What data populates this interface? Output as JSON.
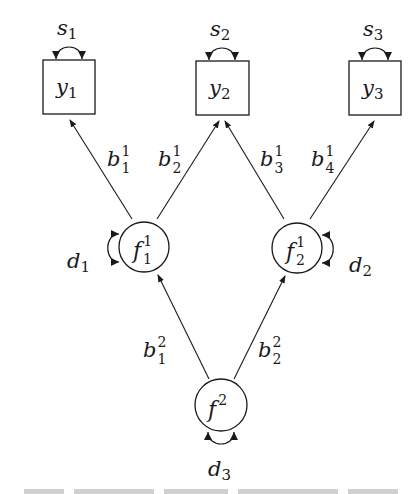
{
  "diagram": {
    "type": "path-diagram",
    "observed": [
      {
        "id": "y1",
        "name": "y",
        "sub": "1",
        "error": {
          "name": "s",
          "sub": "1"
        }
      },
      {
        "id": "y2",
        "name": "y",
        "sub": "2",
        "error": {
          "name": "s",
          "sub": "2"
        }
      },
      {
        "id": "y3",
        "name": "y",
        "sub": "3",
        "error": {
          "name": "s",
          "sub": "3"
        }
      }
    ],
    "first_order_factors": [
      {
        "id": "f1_1",
        "name": "f",
        "sup": "1",
        "sub": "1",
        "disturbance": {
          "name": "d",
          "sub": "1"
        }
      },
      {
        "id": "f2_1",
        "name": "f",
        "sup": "1",
        "sub": "2",
        "disturbance": {
          "name": "d",
          "sub": "2"
        }
      }
    ],
    "second_order_factor": {
      "id": "f2",
      "name": "f",
      "sup": "2",
      "disturbance": {
        "name": "d",
        "sub": "3"
      }
    },
    "loadings_level1": [
      {
        "name": "b",
        "sup": "1",
        "sub": "1",
        "from": "f1_1",
        "to": "y1"
      },
      {
        "name": "b",
        "sup": "1",
        "sub": "2",
        "from": "f1_1",
        "to": "y2"
      },
      {
        "name": "b",
        "sup": "1",
        "sub": "3",
        "from": "f2_1",
        "to": "y2"
      },
      {
        "name": "b",
        "sup": "1",
        "sub": "4",
        "from": "f2_1",
        "to": "y3"
      }
    ],
    "loadings_level2": [
      {
        "name": "b",
        "sup": "2",
        "sub": "1",
        "from": "f2",
        "to": "f1_1"
      },
      {
        "name": "b",
        "sup": "2",
        "sub": "2",
        "from": "f2",
        "to": "f2_1"
      }
    ]
  }
}
